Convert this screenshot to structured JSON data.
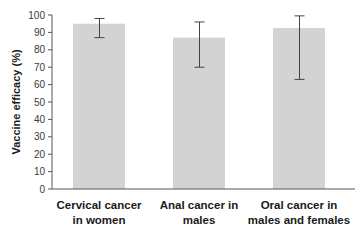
{
  "chart_data": {
    "type": "bar",
    "title": "",
    "xlabel": "",
    "ylabel": "Vaccine efficacy (%)",
    "ylim": [
      0,
      100
    ],
    "yticks": [
      0,
      10,
      20,
      30,
      40,
      50,
      60,
      70,
      80,
      90,
      100
    ],
    "grid": false,
    "legend": null,
    "categories": [
      [
        "Cervical cancer",
        "in women"
      ],
      [
        "Anal cancer in",
        "males"
      ],
      [
        "Oral cancer in",
        "males and females"
      ]
    ],
    "values": [
      95,
      87,
      92.5
    ],
    "error_bars": [
      {
        "low": 87,
        "high": 98
      },
      {
        "low": 70,
        "high": 96
      },
      {
        "low": 63,
        "high": 99.5
      }
    ],
    "colors": {
      "bar": "#d3d3d3",
      "axis": "#555555",
      "error_bar": "#444444"
    }
  }
}
